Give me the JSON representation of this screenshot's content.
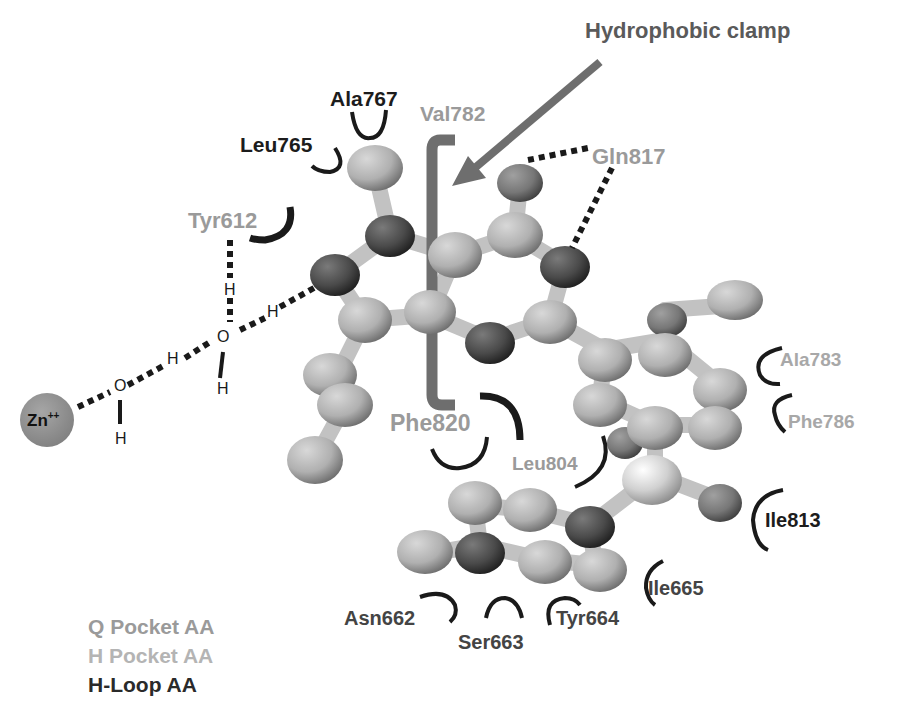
{
  "title": "Hydrophobic clamp",
  "colors": {
    "q_pocket": "#9a9a9a",
    "h_pocket": "#a8a8a8",
    "h_loop": "#1c1c1c",
    "clamp": "#6e6e6e",
    "zinc": "#8c8c8c"
  },
  "residues": {
    "ala767": "Ala767",
    "leu765": "Leu765",
    "val782": "Val782",
    "gln817": "Gln817",
    "tyr612": "Tyr612",
    "ala783": "Ala783",
    "phe786": "Phe786",
    "phe820": "Phe820",
    "leu804": "Leu804",
    "ile813": "Ile813",
    "ile665": "Ile665",
    "asn662": "Asn662",
    "ser663": "Ser663",
    "tyr664": "Tyr664"
  },
  "ion": {
    "label": "Zn",
    "charge": "++"
  },
  "water": {
    "o1": "O",
    "o2": "O",
    "h_labels": [
      "H",
      "H",
      "H",
      "H",
      "H",
      "H"
    ]
  },
  "legend": {
    "items": [
      {
        "label": "Q Pocket AA"
      },
      {
        "label": "H Pocket AA"
      },
      {
        "label": "H-Loop AA"
      }
    ]
  }
}
